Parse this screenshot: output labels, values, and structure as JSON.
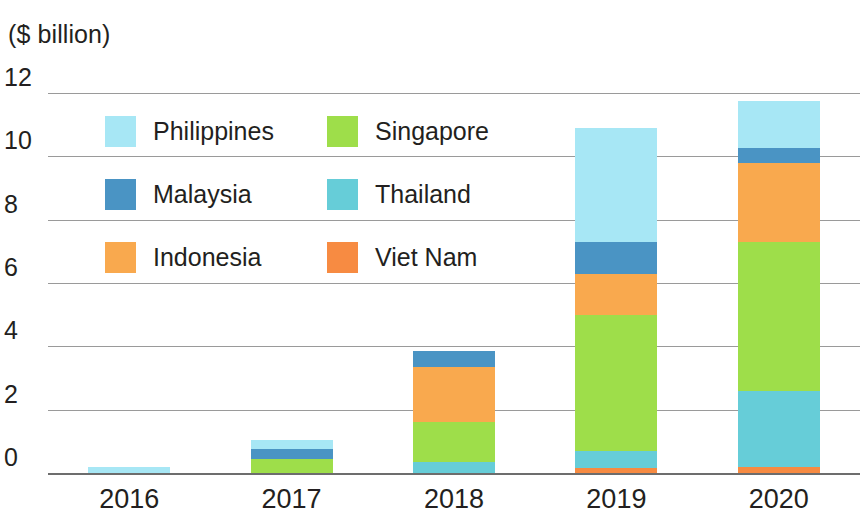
{
  "chart_data": {
    "type": "bar",
    "stacked": true,
    "title": "",
    "subtitle": "",
    "unit_label": "($ billion)",
    "xlabel": "",
    "ylabel": "($ billion)",
    "categories": [
      "2016",
      "2017",
      "2018",
      "2019",
      "2020"
    ],
    "yticks": [
      "0",
      "2",
      "4",
      "6",
      "8",
      "10",
      "12"
    ],
    "ytick_values": [
      0,
      2,
      4,
      6,
      8,
      10,
      12
    ],
    "ylim": [
      0,
      12
    ],
    "grid": true,
    "legend_position": "inside-upper-left",
    "stack_order_bottom_to_top": [
      "Viet Nam",
      "Thailand",
      "Singapore",
      "Indonesia",
      "Malaysia",
      "Philippines"
    ],
    "series": [
      {
        "name": "Philippines",
        "color": "#a7e7f5",
        "values": [
          0.2,
          0.28,
          0.0,
          3.6,
          1.5
        ]
      },
      {
        "name": "Singapore",
        "color": "#9ede4a",
        "values": [
          0.0,
          0.45,
          1.25,
          4.3,
          4.7
        ]
      },
      {
        "name": "Malaysia",
        "color": "#4a94c4",
        "values": [
          0.0,
          0.32,
          0.5,
          1.0,
          0.45
        ]
      },
      {
        "name": "Thailand",
        "color": "#66cdd8",
        "values": [
          0.0,
          0.0,
          0.35,
          0.55,
          2.4
        ]
      },
      {
        "name": "Indonesia",
        "color": "#f9a94e",
        "values": [
          0.0,
          0.0,
          1.75,
          1.3,
          2.5
        ]
      },
      {
        "name": "Viet Nam",
        "color": "#f78b42",
        "values": [
          0.0,
          0.0,
          0.0,
          0.15,
          0.2
        ]
      }
    ],
    "totals": [
      0.2,
      1.05,
      3.85,
      10.9,
      11.75
    ]
  },
  "legend": {
    "items": [
      {
        "label": "Philippines",
        "color": "#a7e7f5"
      },
      {
        "label": "Singapore",
        "color": "#9ede4a"
      },
      {
        "label": "Malaysia",
        "color": "#4a94c4"
      },
      {
        "label": "Thailand",
        "color": "#66cdd8"
      },
      {
        "label": "Indonesia",
        "color": "#f9a94e"
      },
      {
        "label": "Viet Nam",
        "color": "#f78b42"
      }
    ]
  },
  "colors": {
    "gridline": "#9a9a9a",
    "axis": "#6d6d6d",
    "text": "#231f20",
    "background": "#ffffff"
  }
}
